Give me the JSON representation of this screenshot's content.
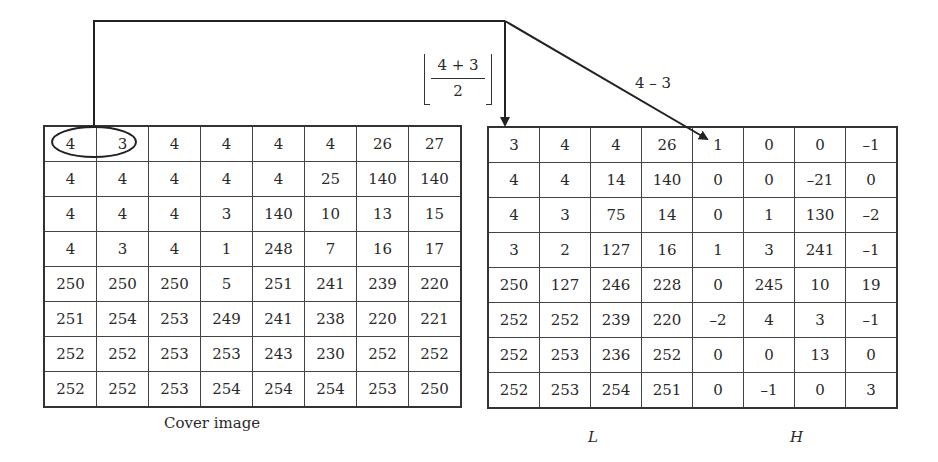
{
  "cover_image": {
    "caption": "Cover image",
    "highlighted_pair": [
      4,
      3
    ],
    "rows": [
      [
        "4",
        "3",
        "4",
        "4",
        "4",
        "4",
        "26",
        "27"
      ],
      [
        "4",
        "4",
        "4",
        "4",
        "4",
        "25",
        "140",
        "140"
      ],
      [
        "4",
        "4",
        "4",
        "3",
        "140",
        "10",
        "13",
        "15"
      ],
      [
        "4",
        "3",
        "4",
        "1",
        "248",
        "7",
        "16",
        "17"
      ],
      [
        "250",
        "250",
        "250",
        "5",
        "251",
        "241",
        "239",
        "220"
      ],
      [
        "251",
        "254",
        "253",
        "249",
        "241",
        "238",
        "220",
        "221"
      ],
      [
        "252",
        "252",
        "253",
        "253",
        "243",
        "230",
        "252",
        "252"
      ],
      [
        "252",
        "252",
        "253",
        "254",
        "254",
        "254",
        "253",
        "250"
      ]
    ]
  },
  "transform": {
    "average_label": {
      "numerator": "4 + 3",
      "denominator": "2",
      "operator": "floor"
    },
    "difference_label": "4 – 3"
  },
  "result": {
    "low_caption": "L",
    "high_caption": "H",
    "rows": [
      [
        "3",
        "4",
        "4",
        "26",
        "1",
        "0",
        "0",
        "–1"
      ],
      [
        "4",
        "4",
        "14",
        "140",
        "0",
        "0",
        "–21",
        "0"
      ],
      [
        "4",
        "3",
        "75",
        "14",
        "0",
        "1",
        "130",
        "–2"
      ],
      [
        "3",
        "2",
        "127",
        "16",
        "1",
        "3",
        "241",
        "–1"
      ],
      [
        "250",
        "127",
        "246",
        "228",
        "0",
        "245",
        "10",
        "19"
      ],
      [
        "252",
        "252",
        "239",
        "220",
        "–2",
        "4",
        "3",
        "–1"
      ],
      [
        "252",
        "253",
        "236",
        "252",
        "0",
        "0",
        "13",
        "0"
      ],
      [
        "252",
        "253",
        "254",
        "251",
        "0",
        "–1",
        "0",
        "3"
      ]
    ]
  }
}
